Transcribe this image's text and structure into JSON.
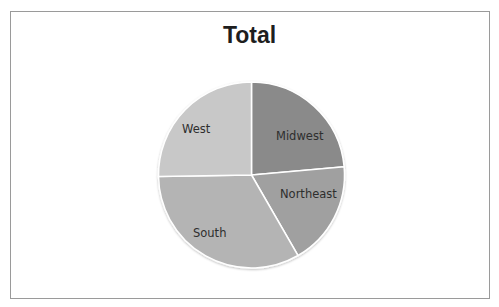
{
  "chart_data": {
    "type": "pie",
    "title": "Total",
    "categories": [
      "Midwest",
      "Northeast",
      "South",
      "West"
    ],
    "values": [
      23.6,
      18.1,
      33.1,
      25.3
    ],
    "units": "percent (estimated from slice angles)",
    "start_angle_deg": 0,
    "direction": "clockwise",
    "colors": [
      "#8a8a8a",
      "#a0a0a0",
      "#b4b4b4",
      "#c8c8c8"
    ],
    "labels_inside": true,
    "legend": "none"
  },
  "labels": {
    "midwest": "Midwest",
    "northeast": "Northeast",
    "south": "South",
    "west": "West"
  }
}
